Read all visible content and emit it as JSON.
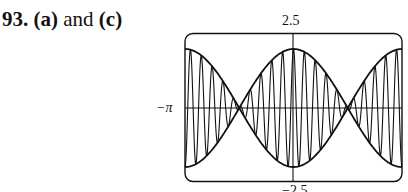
{
  "problem": {
    "number": "93.",
    "text_parts": [
      "(a)",
      " and ",
      "(c)"
    ]
  },
  "chart_data": {
    "type": "line",
    "title": "",
    "xlabel": "",
    "ylabel": "",
    "xlim": [
      -3.14159,
      3.14159
    ],
    "ylim": [
      -2.5,
      2.5
    ],
    "x_tick_labels": {
      "left": "−π"
    },
    "y_tick_labels": {
      "top": "2.5",
      "bottom": "−2.5"
    },
    "grid": false,
    "legend": null,
    "series": [
      {
        "name": "upper envelope",
        "formula": "2cos(x)",
        "amplitude": 2
      },
      {
        "name": "lower envelope",
        "formula": "-2cos(x)",
        "amplitude": 2
      },
      {
        "name": "modulated oscillation",
        "formula": "2cos(x)·cos(~20x)",
        "cycles_across_window": 20
      }
    ],
    "envelope_nodes_x": [
      -1.5708,
      1.5708
    ]
  },
  "labels": {
    "y_max": "2.5",
    "y_min": "−2.5",
    "x_min": "−π"
  }
}
